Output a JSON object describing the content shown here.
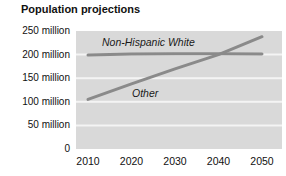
{
  "chart_data": {
    "type": "line",
    "title": "Population projections",
    "x": [
      2010,
      2020,
      2030,
      2040,
      2050
    ],
    "x_tick_labels": [
      "2010",
      "2020",
      "2030",
      "2040",
      "2050"
    ],
    "series": [
      {
        "name": "Non-Hispanic White",
        "values": [
          199,
          201,
          202,
          202,
          201
        ]
      },
      {
        "name": "Other",
        "values": [
          105,
          138,
          170,
          200,
          238
        ]
      }
    ],
    "ylim": [
      0,
      250
    ],
    "yticks": [
      {
        "value": 250,
        "label": "250 million"
      },
      {
        "value": 200,
        "label": "200 million"
      },
      {
        "value": 150,
        "label": "150 million"
      },
      {
        "value": 100,
        "label": "100 million"
      },
      {
        "value": 50,
        "label": "50 million"
      },
      {
        "value": 0,
        "label": "0"
      }
    ],
    "gridline_values": [
      50,
      100,
      150,
      200
    ],
    "grid": "horizontal-white",
    "legend": "inline-series-labels",
    "xlabel": "",
    "ylabel": "",
    "colors": {
      "line": "#8a8a8a",
      "plot_background": "#d9d9d9",
      "gridline": "#f4f4f4",
      "text": "#111111",
      "background": "#ffffff"
    },
    "series_label_positions": [
      {
        "left": 102,
        "top": 36
      },
      {
        "left": 132,
        "top": 87
      }
    ]
  }
}
